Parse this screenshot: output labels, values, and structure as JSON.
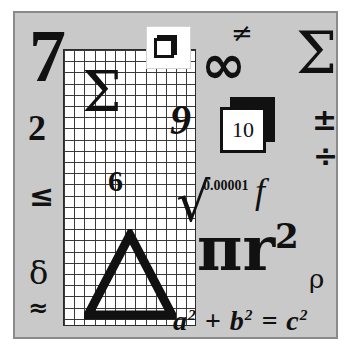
{
  "panel": {
    "background_color": "#c9c9c9",
    "border_color": "#8a8a8a",
    "page_background": "#ffffff",
    "ink_color": "#111111"
  },
  "left_column": {
    "digit_seven": "7",
    "digit_two": "2",
    "less_than_or_equal": "≤",
    "greek_delta_lower": "δ",
    "approximately_equal": "≈"
  },
  "sheet": {
    "background_color": "#ffffff",
    "gridline_color": "#3a3a3a",
    "columns": 13,
    "rows": 25,
    "overlay": {
      "summation_sigma": "Σ",
      "digit_six": "6",
      "triangle_delta": "Δ"
    }
  },
  "icon_box": {
    "name": "layered-square-icon",
    "background_color": "#ffffff"
  },
  "middle_column": {
    "digit_nine": "9",
    "not_equal": "≠",
    "infinity": "∞",
    "square_root": "√",
    "small_number": "0.00001",
    "function_f": "f"
  },
  "ten_badge": {
    "value": "10",
    "front_color": "#ffffff",
    "shadow_color": "#111111"
  },
  "right_column": {
    "capital_sigma": "Σ",
    "plus_minus": "±",
    "division_sign": "÷"
  },
  "area_formula": {
    "base": "πr",
    "exponent": "2",
    "greek_rho": "ρ"
  },
  "pythagorean": {
    "a": "a",
    "a_exp": "2",
    "plus": "+",
    "b": "b",
    "b_exp": "2",
    "equals": "=",
    "c": "c",
    "c_exp": "2"
  }
}
